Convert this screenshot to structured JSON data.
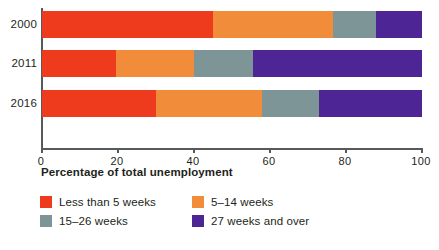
{
  "chart_data": {
    "type": "bar",
    "orientation": "horizontal",
    "stacked": true,
    "normalized": true,
    "title": "",
    "subtitle": "",
    "xlabel": "Percentage of total unemployment",
    "ylabel": "",
    "categories": [
      "2000",
      "2011",
      "2016"
    ],
    "xlim": [
      0,
      100
    ],
    "xticks": [
      0,
      20,
      40,
      60,
      80,
      100
    ],
    "xtick_labels": [
      "0",
      "20",
      "40",
      "60",
      "80",
      "100"
    ],
    "grid": false,
    "legend_position": "bottom-left",
    "series": [
      {
        "name": "Less than 5 weeks",
        "color": "#ee3b1e",
        "values": [
          45,
          19.5,
          30
        ]
      },
      {
        "name": "5–14 weeks",
        "color": "#f08c3a",
        "values": [
          31.5,
          20.5,
          28
        ]
      },
      {
        "name": "15–26 weeks",
        "color": "#7d9597",
        "values": [
          11.5,
          15.5,
          15
        ]
      },
      {
        "name": "27 weeks and over",
        "color": "#4d2594",
        "values": [
          12,
          44.5,
          27
        ]
      }
    ],
    "cumulative_boundaries": {
      "2000": [
        45,
        76.5,
        88,
        100
      ],
      "2011": [
        19.5,
        40,
        55.5,
        100
      ],
      "2016": [
        30,
        58,
        73,
        100
      ]
    }
  },
  "legend": {
    "items": [
      {
        "label": "Less than 5 weeks",
        "color": "#ee3b1e",
        "swatch_name": "legend-swatch-less-than-5-weeks"
      },
      {
        "label": "5–14 weeks",
        "color": "#f08c3a",
        "swatch_name": "legend-swatch-5-to-14-weeks"
      },
      {
        "label": "15–26 weeks",
        "color": "#7d9597",
        "swatch_name": "legend-swatch-15-to-26-weeks"
      },
      {
        "label": "27 weeks and over",
        "color": "#4d2594",
        "swatch_name": "legend-swatch-27-weeks-and-over"
      }
    ]
  },
  "axis": {
    "line_color": "#58595b",
    "text_color": "#231f20"
  },
  "background": "#ffffff"
}
